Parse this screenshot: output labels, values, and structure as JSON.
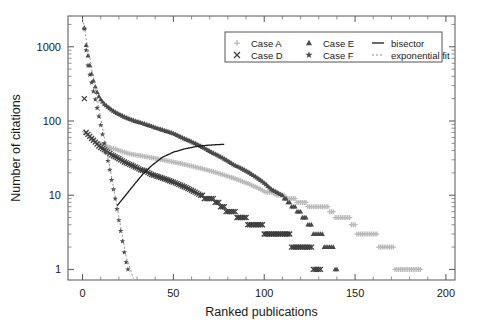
{
  "chart_data": {
    "type": "scatter",
    "title": "",
    "xlabel": "Ranked publications",
    "ylabel": "Number of citations",
    "xlim": [
      -8,
      205
    ],
    "ylim": [
      0.72,
      2600
    ],
    "yscale": "log",
    "xscale": "linear",
    "grid": false,
    "legend_position": "top-right",
    "xticks": [
      0,
      50,
      100,
      150,
      200
    ],
    "xticklabels": [
      "0",
      "50",
      "100",
      "150",
      "200"
    ],
    "yticks": [
      1,
      10,
      100,
      1000
    ],
    "yticklabels": [
      "1",
      "10",
      "100",
      "1000"
    ],
    "series": [
      {
        "name": "Case A",
        "marker": "plus",
        "color": "#b8b8b8",
        "x": [
          1,
          2,
          3,
          4,
          5,
          6,
          7,
          8,
          9,
          10,
          12,
          14,
          16,
          18,
          20,
          23,
          26,
          29,
          32,
          35,
          38,
          41,
          44,
          47,
          50,
          53,
          56,
          59,
          62,
          65,
          68,
          71,
          74,
          77,
          80,
          83,
          86,
          89,
          92,
          95,
          98,
          101,
          104,
          107,
          110,
          113,
          116,
          119,
          122,
          125,
          128,
          131,
          134,
          137,
          140,
          143,
          146,
          149,
          152,
          155,
          158,
          161,
          164,
          167,
          170,
          173,
          176,
          179,
          182,
          185,
          186
        ],
        "y": [
          72,
          68,
          64,
          60,
          57,
          55,
          53,
          51,
          50,
          49,
          47,
          45,
          43,
          42,
          40,
          38,
          36,
          35,
          34,
          33,
          32,
          31,
          30,
          29,
          28,
          27,
          26,
          25,
          24,
          23,
          22,
          21,
          20,
          19,
          18,
          17,
          16,
          15,
          14,
          13,
          12,
          11,
          11,
          10,
          10,
          9,
          9,
          8,
          8,
          7,
          7,
          7,
          7,
          6,
          5,
          5,
          5,
          4,
          3,
          3,
          3,
          3,
          2,
          2,
          2,
          1,
          1,
          1,
          1,
          1,
          1
        ]
      },
      {
        "name": "Case D",
        "marker": "cross",
        "color": "#3d3d3d",
        "x": [
          1,
          2,
          3,
          4,
          5,
          6,
          7,
          8,
          9,
          10,
          12,
          14,
          16,
          18,
          20,
          23,
          26,
          29,
          32,
          35,
          38,
          41,
          44,
          47,
          50,
          53,
          56,
          59,
          62,
          65,
          68,
          71,
          74,
          77,
          80,
          83,
          86,
          89,
          92,
          95,
          98,
          101,
          104,
          107,
          110,
          113,
          116,
          119,
          122,
          125,
          128,
          131
        ],
        "y": [
          200,
          70,
          66,
          62,
          58,
          55,
          52,
          49,
          46,
          44,
          41,
          38,
          35,
          33,
          31,
          28,
          26,
          24,
          22,
          21,
          19,
          18,
          17,
          16,
          15,
          14,
          13,
          12,
          11,
          10,
          9,
          9,
          8,
          7,
          6,
          6,
          5,
          5,
          4,
          4,
          4,
          3,
          3,
          3,
          3,
          3,
          2,
          2,
          2,
          2,
          1,
          1
        ]
      },
      {
        "name": "Case E",
        "marker": "triangle",
        "color": "#4a4a4a",
        "x": [
          1,
          2,
          3,
          4,
          5,
          6,
          7,
          8,
          9,
          10,
          12,
          14,
          16,
          18,
          20,
          23,
          26,
          29,
          32,
          35,
          38,
          41,
          44,
          47,
          50,
          53,
          56,
          59,
          62,
          65,
          68,
          71,
          74,
          77,
          80,
          83,
          86,
          89,
          92,
          95,
          98,
          101,
          104,
          107,
          110,
          113,
          116,
          119,
          122,
          125,
          128,
          131,
          134,
          137,
          140
        ],
        "y": [
          1800,
          1050,
          760,
          560,
          430,
          350,
          290,
          245,
          215,
          195,
          170,
          155,
          142,
          132,
          124,
          114,
          106,
          100,
          95,
          90,
          85,
          80,
          76,
          72,
          68,
          63,
          58,
          54,
          50,
          46,
          42,
          38,
          35,
          32,
          29,
          26,
          24,
          22,
          20,
          18,
          16,
          14,
          12,
          11,
          10,
          8,
          7,
          6,
          5,
          4,
          3,
          3,
          2,
          2,
          1
        ]
      },
      {
        "name": "Case F",
        "marker": "star",
        "color": "#4a4a4a",
        "x": [
          1,
          2,
          3,
          4,
          5,
          6,
          7,
          8,
          9,
          10,
          11,
          12,
          13,
          14,
          15,
          16,
          17,
          18,
          19,
          20,
          21,
          22,
          23,
          24,
          25
        ],
        "y": [
          1750,
          900,
          560,
          420,
          330,
          250,
          195,
          150,
          115,
          88,
          66,
          50,
          38,
          29,
          22,
          16,
          12,
          9,
          6.5,
          4.6,
          3.3,
          2.4,
          1.7,
          1.25,
          1.0
        ]
      }
    ],
    "lines": [
      {
        "name": "bisector",
        "style": "solid",
        "color": "#1a1a1a",
        "x": [
          19,
          23,
          28,
          33,
          38,
          44,
          50,
          56,
          62,
          68,
          74,
          78
        ],
        "y": [
          7.2,
          9.5,
          13.5,
          19,
          25,
          32.5,
          38,
          42,
          45,
          47,
          48,
          48.5
        ]
      },
      {
        "name": "exponential fit",
        "style": "dashed",
        "color": "#8a8a8a",
        "x": [
          0,
          4,
          8,
          12,
          16,
          20,
          24,
          28
        ],
        "y": [
          2400,
          700,
          205,
          60,
          17.5,
          5.1,
          1.5,
          0.75
        ]
      }
    ],
    "legend": [
      {
        "label": "Case A",
        "marker": "plus",
        "color": "#b8b8b8"
      },
      {
        "label": "Case E",
        "marker": "triangle",
        "color": "#4a4a4a"
      },
      {
        "label": "bisector",
        "marker": "line",
        "color": "#1a1a1a"
      },
      {
        "label": "Case D",
        "marker": "cross",
        "color": "#3d3d3d"
      },
      {
        "label": "Case F",
        "marker": "star",
        "color": "#4a4a4a"
      },
      {
        "label": "exponential fit",
        "marker": "dashline",
        "color": "#8a8a8a"
      }
    ]
  },
  "axes": {
    "xlabel": "Ranked publications",
    "ylabel": "Number of citations"
  }
}
